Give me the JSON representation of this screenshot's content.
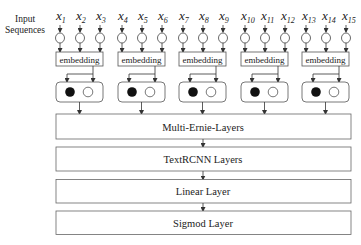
{
  "diagram": {
    "input_label_line1": "Input",
    "input_label_line2": "Sequences",
    "groups": [
      {
        "inputs": [
          "x",
          "x",
          "x"
        ],
        "subs": [
          "1",
          "2",
          "3"
        ],
        "embedding_label": "embedding"
      },
      {
        "inputs": [
          "x",
          "x",
          "x"
        ],
        "subs": [
          "4",
          "5",
          "6"
        ],
        "embedding_label": "embedding"
      },
      {
        "inputs": [
          "x",
          "x",
          "x"
        ],
        "subs": [
          "7",
          "8",
          "9"
        ],
        "embedding_label": "embedding"
      },
      {
        "inputs": [
          "x",
          "x",
          "x"
        ],
        "subs": [
          "10",
          "11",
          "12"
        ],
        "embedding_label": "embedding"
      },
      {
        "inputs": [
          "x",
          "x",
          "x"
        ],
        "subs": [
          "13",
          "14",
          "15"
        ],
        "embedding_label": "embedding"
      }
    ],
    "layers": [
      {
        "label": "Multi-Ernie-Layers"
      },
      {
        "label": "TextRCNN Layers"
      },
      {
        "label": "Linear Layer"
      },
      {
        "label": "Sigmod Layer"
      }
    ],
    "colors": {
      "stroke": "#555555",
      "filled_node": "#111111",
      "text": "#222222",
      "background": "#ffffff"
    }
  }
}
